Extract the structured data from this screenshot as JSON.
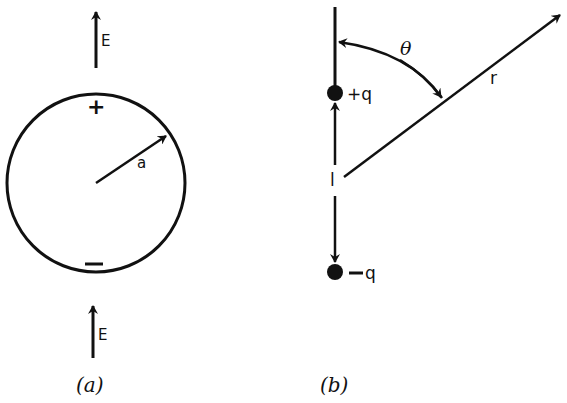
{
  "figure_a": {
    "caption": "(a)",
    "field_label_top": "E",
    "field_label_bottom": "E",
    "plus_sign": "+",
    "minus_sign": "—",
    "radius_label": "a"
  },
  "figure_b": {
    "caption": "(b)",
    "positive_charge_label": "+q",
    "negative_charge_label": "−q",
    "separation_label": "l",
    "distance_label": "r",
    "angle_label": "θ"
  },
  "colors": {
    "stroke": "#111111",
    "background": "#ffffff"
  }
}
